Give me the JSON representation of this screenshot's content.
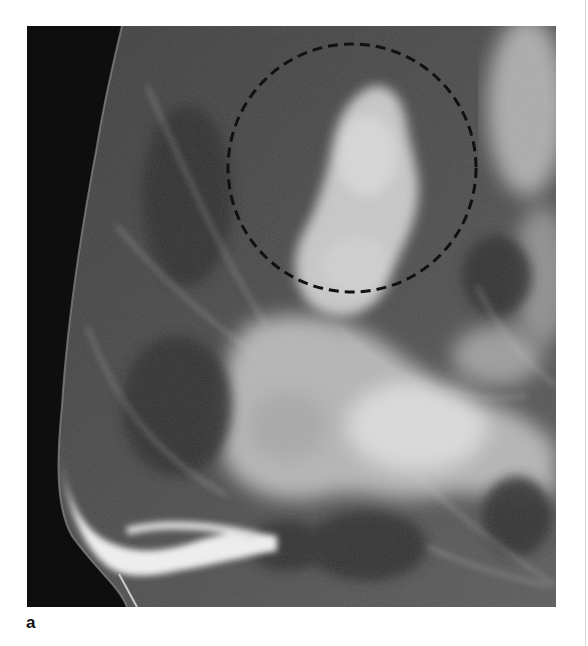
{
  "figure": {
    "panel_label": "a",
    "type": "mammogram",
    "view": "mediolateral oblique (left-facing)",
    "annotation": {
      "shape": "dashed-circle",
      "color": "#111111",
      "center": [
        352,
        168
      ],
      "radius": 125,
      "description": "region of interest outlined by a dashed circle around a dense tissue area"
    },
    "colors": {
      "background": "#ffffff",
      "air": "#0d0d0d",
      "tissue_dark": "#3a3a3a",
      "tissue_mid": "#7a7a7a",
      "tissue_bright": "#e6e6e6",
      "skin_line": "#f5f5f5"
    }
  }
}
